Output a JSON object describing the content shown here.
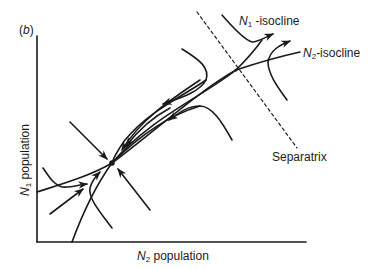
{
  "figure": {
    "panel_label_open": "(",
    "panel_label_letter": "b",
    "panel_label_close": ")",
    "x_axis": {
      "symbol": "N",
      "subscript": "2",
      "text": " population"
    },
    "y_axis": {
      "symbol": "N",
      "subscript": "1",
      "text": " population"
    },
    "labels": {
      "n1_isocline": {
        "symbol": "N",
        "subscript": "1",
        "text": " -isocline"
      },
      "n2_isocline": {
        "symbol": "N",
        "subscript": "2",
        "text": "-isocline"
      },
      "separatrix": "Separatrix"
    },
    "points": {
      "stable_equilibrium": "stable-node",
      "saddle_point": "isocline-intersection"
    },
    "colors": {
      "line": "#1a1a1a",
      "background": "#ffffff"
    }
  }
}
